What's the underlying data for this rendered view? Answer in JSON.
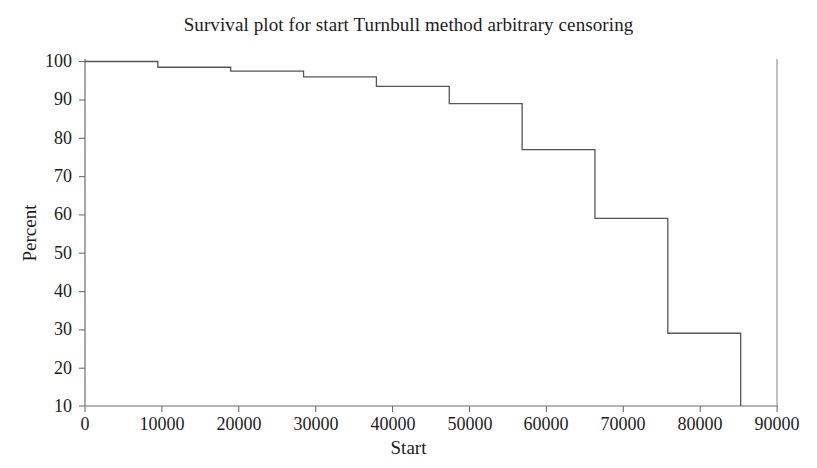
{
  "chart_data": {
    "type": "line",
    "subtype": "step-survival-curve",
    "title": "Survival plot for start Turnbull method arbitrary censoring",
    "xlabel": "Start",
    "ylabel": "Percent",
    "xlim": [
      0,
      95000
    ],
    "ylim": [
      10,
      100
    ],
    "grid": false,
    "legend": null,
    "xticks": [
      0,
      10000,
      20000,
      30000,
      40000,
      50000,
      60000,
      70000,
      80000,
      90000
    ],
    "xtick_labels": [
      "0",
      "10000",
      "20000",
      "30000",
      "40000",
      "50000",
      "60000",
      "70000",
      "80000",
      "90000"
    ],
    "yticks": [
      10,
      20,
      30,
      40,
      50,
      60,
      70,
      80,
      90,
      100
    ],
    "ytick_labels": [
      "10",
      "20",
      "30",
      "40",
      "50",
      "60",
      "70",
      "80",
      "90",
      "100"
    ],
    "line_color": "#555555",
    "axis_color": "#6e6e6e",
    "background": "#ffffff",
    "x": [
      0,
      10000,
      20000,
      30000,
      40000,
      50000,
      60000,
      70000,
      80000,
      90000
    ],
    "values": [
      100,
      98.5,
      97.5,
      96,
      93.5,
      89,
      77,
      59,
      29,
      10
    ],
    "steps": [
      {
        "x_start": 0,
        "x_end": 10000,
        "percent": 100
      },
      {
        "x_start": 10000,
        "x_end": 20000,
        "percent": 98.5
      },
      {
        "x_start": 20000,
        "x_end": 30000,
        "percent": 97.5
      },
      {
        "x_start": 30000,
        "x_end": 40000,
        "percent": 96
      },
      {
        "x_start": 40000,
        "x_end": 50000,
        "percent": 93.5
      },
      {
        "x_start": 50000,
        "x_end": 60000,
        "percent": 89
      },
      {
        "x_start": 60000,
        "x_end": 70000,
        "percent": 77
      },
      {
        "x_start": 70000,
        "x_end": 80000,
        "percent": 59
      },
      {
        "x_start": 80000,
        "x_end": 90000,
        "percent": 29
      },
      {
        "x_start": 90000,
        "x_end": 90000,
        "percent": 10
      }
    ]
  },
  "axes": {
    "y_labels": [
      "100",
      "90",
      "80",
      "70",
      "60",
      "50",
      "40",
      "30",
      "20",
      "10"
    ],
    "x_labels": [
      "0",
      "10000",
      "20000",
      "30000",
      "40000",
      "50000",
      "60000",
      "70000",
      "80000",
      "90000"
    ]
  }
}
